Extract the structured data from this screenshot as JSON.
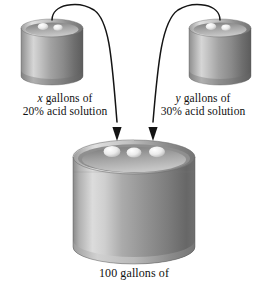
{
  "diagram": {
    "background": "#ffffff",
    "ink": "#111111",
    "metal": {
      "light": "#e3e3e3",
      "mid": "#9a9a9a",
      "dark": "#5e5e5e",
      "shadow": "#4a4a4a",
      "rim": "#b9b9b9",
      "cap": "#f2f2f2"
    }
  },
  "labels": {
    "left": {
      "line1_var": "x",
      "line1_rest": " gallons of",
      "line2": "20% acid solution"
    },
    "right": {
      "line1_var": "y",
      "line1_rest": " gallons of",
      "line2": "30% acid solution"
    },
    "bottom": {
      "line1": "100 gallons of"
    }
  },
  "objects": {
    "small_drum_left": "20-percent-acid-drum",
    "small_drum_right": "30-percent-acid-drum",
    "large_drum": "100-gallon-mixture-drum",
    "arrow_left": "pour-arrow-from-left-drum",
    "arrow_right": "pour-arrow-from-right-drum"
  }
}
